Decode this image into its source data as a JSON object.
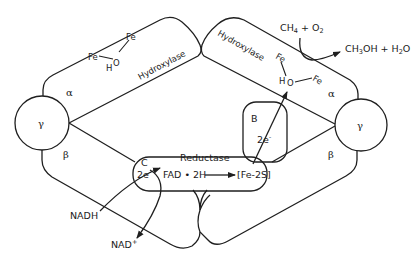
{
  "diagram": {
    "colors": {
      "stroke": "#1f1f1f",
      "background": "#ffffff",
      "text": "#1a1a1a"
    },
    "subunits": {
      "left": {
        "alpha": "α",
        "beta": "β",
        "gamma": "γ",
        "domain_label": "Hydroxylase"
      },
      "right": {
        "alpha": "α",
        "beta": "β",
        "gamma": "γ",
        "domain_label": "Hydroxylase"
      }
    },
    "active_site": {
      "left": {
        "fe1": "Fe",
        "fe2": "Fe",
        "o": "O",
        "h": "H"
      },
      "right": {
        "fe1": "Fe",
        "fe2": "Fe",
        "o": "O",
        "h": "H"
      }
    },
    "reductase": {
      "label": "Reductase",
      "domain_c": "C",
      "electrons_c": "2e",
      "electron_sup": "-",
      "fad": "FAD • 2H",
      "fe_s": "[Fe-2S]"
    },
    "component_b": {
      "label": "B",
      "electrons": "2e",
      "electron_sup": "-"
    },
    "reaction": {
      "substrate_ch": "CH",
      "substrate_sub4": "4",
      "substrate_plus": " + O",
      "substrate_sub2": "2",
      "product_ch3oh_a": "CH",
      "product_sub3": "3",
      "product_ch3oh_b": "OH + H",
      "product_sub2": "2",
      "product_o": "O"
    },
    "cofactors": {
      "nadh": "NADH",
      "nad": "NAD",
      "nad_sup": "+"
    }
  }
}
